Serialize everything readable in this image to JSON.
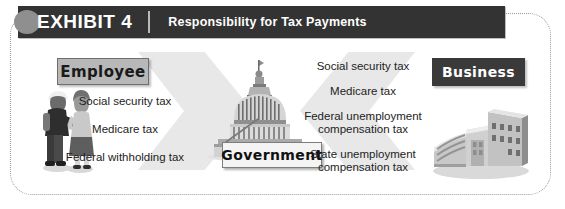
{
  "header": {
    "exhibit_label": "EXHIBIT 4",
    "title": "Responsibility for Tax Payments",
    "bar_color": "#333333",
    "text_color": "#ffffff"
  },
  "employee": {
    "box_label": "Employee",
    "box_color": "#b8b8b8",
    "taxes": [
      "Social security tax",
      "Medicare tax",
      "Federal withholding tax"
    ]
  },
  "government": {
    "box_label": "Government",
    "box_color": "#f4f4f4"
  },
  "business": {
    "box_label": "Business",
    "box_color": "#3a3a3a",
    "taxes": [
      {
        "line1": "Social security tax",
        "line2": ""
      },
      {
        "line1": "Medicare tax",
        "line2": ""
      },
      {
        "line1": "Federal unemployment",
        "line2": "compensation tax"
      },
      {
        "line1": "State unemployment",
        "line2": "compensation tax"
      }
    ]
  },
  "arrows": {
    "color": "#e8e8e8",
    "left_direction": "right",
    "right_direction": "left"
  },
  "illustrations": {
    "employee_figures": "two-people-icon",
    "government_building": "capitol-dome-icon",
    "business_building": "office-building-icon"
  }
}
